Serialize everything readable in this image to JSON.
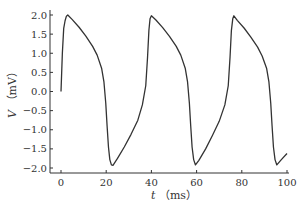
{
  "chart_data": {
    "type": "line",
    "title": "",
    "xlabel": "t",
    "xlabel_unit": "（ms）",
    "ylabel": "V",
    "ylabel_unit": "（mV）",
    "xlim": [
      0,
      100
    ],
    "ylim": [
      -2.0,
      2.0
    ],
    "xticks": [
      0,
      20,
      40,
      60,
      80,
      100
    ],
    "yticks": [
      "2.0",
      "1.5",
      "1.0",
      "0.5",
      "0.0",
      "−0.5",
      "−1.0",
      "−1.5",
      "−2.0"
    ],
    "grid": false,
    "legend": null,
    "line_color": "#333333",
    "series": [
      {
        "name": "V",
        "x": [
          0,
          0.6,
          1.2,
          1.8,
          2.4,
          3.0,
          5,
          8,
          11,
          14,
          16,
          18,
          19,
          19.8,
          20.4,
          21.0,
          21.6,
          22.3,
          23.0,
          25,
          28,
          31,
          34,
          36,
          37.5,
          38.3,
          38.9,
          39.4,
          40.0,
          42,
          45,
          48,
          51,
          53,
          55,
          56,
          56.8,
          57.4,
          58.0,
          58.7,
          59.5,
          61,
          64,
          67,
          70,
          72.5,
          74,
          74.8,
          75.4,
          76.0,
          76.5,
          78,
          81,
          84,
          87,
          89,
          91,
          92,
          92.8,
          93.4,
          94.0,
          94.7,
          95.5,
          97.5,
          100
        ],
        "y": [
          0.0,
          1.0,
          1.65,
          1.85,
          1.97,
          2.0,
          1.88,
          1.68,
          1.45,
          1.18,
          0.95,
          0.6,
          0.25,
          -0.3,
          -0.9,
          -1.45,
          -1.78,
          -1.92,
          -1.93,
          -1.75,
          -1.45,
          -1.12,
          -0.75,
          -0.35,
          0.15,
          0.9,
          1.6,
          1.9,
          1.98,
          1.87,
          1.67,
          1.44,
          1.18,
          0.95,
          0.6,
          0.25,
          -0.3,
          -0.9,
          -1.45,
          -1.78,
          -1.92,
          -1.8,
          -1.5,
          -1.15,
          -0.78,
          -0.35,
          0.15,
          0.9,
          1.6,
          1.9,
          1.98,
          1.86,
          1.66,
          1.42,
          1.16,
          0.93,
          0.6,
          0.25,
          -0.3,
          -0.9,
          -1.45,
          -1.78,
          -1.92,
          -1.78,
          -1.62
        ]
      }
    ]
  }
}
